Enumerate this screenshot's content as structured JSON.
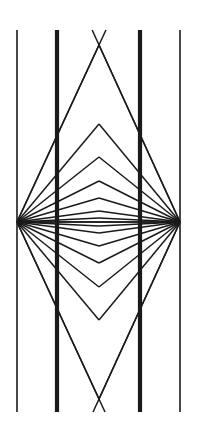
{
  "figure": {
    "type": "line-illusion",
    "background_color": "#ffffff",
    "stroke_color": "#1a1a1a",
    "canvas": {
      "width": 199,
      "height": 432
    },
    "vertices": {
      "left": {
        "x": 17,
        "y": 222
      },
      "right": {
        "x": 180,
        "y": 222
      },
      "center_x": 99
    },
    "vertical_lines": [
      {
        "name": "outer-left-line",
        "x": 17,
        "y_top": 30,
        "y_bottom": 412,
        "width": 1.6,
        "weight": "thin"
      },
      {
        "name": "inner-left-line",
        "x": 57,
        "y_top": 30,
        "y_bottom": 412,
        "width": 4.2,
        "weight": "thick"
      },
      {
        "name": "inner-right-line",
        "x": 140,
        "y_top": 30,
        "y_bottom": 412,
        "width": 4.2,
        "weight": "thick"
      },
      {
        "name": "outer-right-line",
        "x": 180,
        "y_top": 30,
        "y_bottom": 412,
        "width": 1.6,
        "weight": "thin"
      }
    ],
    "chevron_apex_y_top": [
      45,
      124,
      157,
      181,
      198,
      211,
      218,
      222
    ],
    "chevron_apex_y_bottom": [
      399,
      320,
      287,
      263,
      246,
      233,
      226,
      222
    ],
    "ray_stroke_width": 1.5,
    "ray_count_per_vertex": 15,
    "long_ray_overshoot": {
      "enabled": true,
      "description": "outermost rays continue past the chevron apex toward the frame edge",
      "top_y": 30,
      "bottom_y": 412
    }
  }
}
